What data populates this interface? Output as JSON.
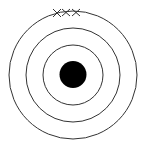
{
  "diagram": {
    "type": "target",
    "center": [
      73,
      75
    ],
    "rings": [
      {
        "name": "outer-ring",
        "r": 64
      },
      {
        "name": "middle-ring",
        "r": 47
      },
      {
        "name": "inner-ring",
        "r": 30
      }
    ],
    "bullseye": {
      "r": 13.5,
      "color": "#000000"
    },
    "marks": [
      {
        "shape": "x",
        "x": 57,
        "y": 13
      },
      {
        "shape": "x",
        "x": 66,
        "y": 12.5
      },
      {
        "shape": "x",
        "x": 76,
        "y": 12.5
      }
    ],
    "stroke_color": "#333333",
    "background": "#ffffff"
  }
}
